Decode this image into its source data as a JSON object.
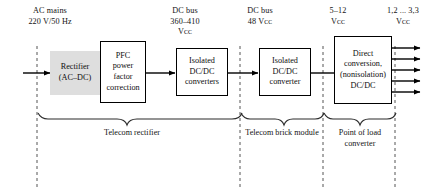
{
  "diagram": {
    "bus_labels": [
      {
        "id": "ac-mains",
        "line1": "AC mains",
        "line2": "220 V/50 Hz",
        "line3": ""
      },
      {
        "id": "dc-bus-hv",
        "line1": "DC bus",
        "line2": "360–410",
        "line3": "Vᴄᴄ"
      },
      {
        "id": "dc-bus-48",
        "line1": "DC bus",
        "line2": "48 Vᴄᴄ",
        "line3": ""
      },
      {
        "id": "rail-5-12",
        "line1": "5–12",
        "line2": "Vᴄᴄ",
        "line3": ""
      },
      {
        "id": "rail-1v2-3v3",
        "line1": "1,2 ... 3,3",
        "line2": "Vᴄᴄ",
        "line3": ""
      }
    ],
    "blocks": [
      {
        "id": "rectifier",
        "lines": [
          "Rectifier",
          "(AC–DC)"
        ],
        "style": "shaded"
      },
      {
        "id": "pfc",
        "lines": [
          "PFC",
          "power",
          "factor",
          "correction"
        ],
        "style": "outlined"
      },
      {
        "id": "isolated-dcdc-converters",
        "lines": [
          "Isolated",
          "DC/DC",
          "converters"
        ],
        "style": "outlined"
      },
      {
        "id": "isolated-dcdc-converter",
        "lines": [
          "Isolated",
          "DC/DC",
          "converter"
        ],
        "style": "outlined"
      },
      {
        "id": "direct-conversion",
        "lines": [
          "Direct",
          "conversion,",
          "(nonisolation)",
          "DC/DC"
        ],
        "style": "outlined"
      }
    ],
    "groups": [
      {
        "id": "telecom-rectifier",
        "lines": [
          "Telecom rectifier"
        ]
      },
      {
        "id": "telecom-brick-module",
        "lines": [
          "Telecom brick module"
        ]
      },
      {
        "id": "point-of-load-converter",
        "lines": [
          "Point of load",
          "converter"
        ]
      }
    ],
    "colors": {
      "line": "#000000",
      "shaded_block_fill": "#dedede",
      "background": "#ffffff",
      "divider": "#555555"
    },
    "output_arrow_count": 5
  }
}
